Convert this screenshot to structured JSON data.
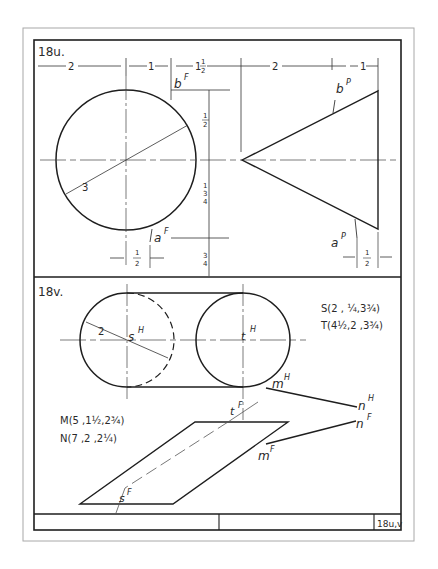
{
  "sheet": {
    "colors": {
      "ink": "#1e1e1e",
      "light": "#555555",
      "paper": "#ffffff",
      "frame_outer": "#9a9a9a"
    }
  },
  "problem_u": {
    "label": "18u.",
    "dims_top": {
      "d1": "2",
      "d2": "1",
      "d3_whole": "1",
      "d3_frac_num": "1",
      "d3_frac_den": "2",
      "d4": "2",
      "d5": "1"
    },
    "dims_side": {
      "top_num": "1",
      "top_den": "2",
      "mid_whole": "1",
      "mid_num": "3",
      "mid_den": "4",
      "bot_num": "3",
      "bot_den": "4"
    },
    "dims_bottom": {
      "left_num": "1",
      "left_den": "2",
      "right_num": "1",
      "right_den": "2"
    },
    "radius_label": "3",
    "points": {
      "bF": "b",
      "bF_sup": "F",
      "aF": "a",
      "aF_sup": "F",
      "bP": "b",
      "bP_sup": "P",
      "aP": "a",
      "aP_sup": "P"
    }
  },
  "problem_v": {
    "label": "18v.",
    "radius_label": "2",
    "coords": {
      "S": "S(2 , ¼,3¾)",
      "T": "T(4½,2 ,3¾)",
      "M": "M(5 ,1½,2¾)",
      "N": "N(7 ,2 ,2¼)"
    },
    "points": {
      "sH": "s",
      "sH_sup": "H",
      "tH": "t",
      "tH_sup": "H",
      "mH": "m",
      "mH_sup": "H",
      "nH": "n",
      "nH_sup": "H",
      "nF": "n",
      "nF_sup": "F",
      "mF": "m",
      "mF_sup": "F",
      "tF": "t",
      "tF_sup": "F",
      "sF": "s",
      "sF_sup": "F"
    }
  },
  "title_block": {
    "sheet_id": "18u,v"
  }
}
